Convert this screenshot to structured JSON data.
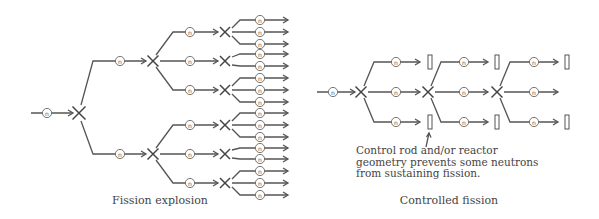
{
  "colors": {
    "line": "#555555",
    "text": "#444444",
    "background": "#ffffff"
  },
  "neutron_label": "n",
  "fission_explosion": {
    "caption": "Fission explosion",
    "input": {
      "x0": 31,
      "nx": 47,
      "x1": 73,
      "y": 113
    },
    "root_x": {
      "x": 79,
      "y": 113
    },
    "level2": [
      {
        "y": 61,
        "branch_x": 93,
        "nx": 120,
        "arrow_end": 146,
        "x_at": 153
      },
      {
        "y": 154,
        "branch_x": 93,
        "nx": 120,
        "arrow_end": 146,
        "x_at": 153
      }
    ],
    "level3": [
      {
        "parent": 0,
        "y": 32,
        "nx": 190,
        "arrow_end": 218,
        "x_at": 225,
        "outputs": [
          20,
          32,
          44
        ]
      },
      {
        "parent": 0,
        "y": 61,
        "nx": 190,
        "arrow_end": 218,
        "x_at": 225,
        "outputs": [
          54,
          66
        ]
      },
      {
        "parent": 0,
        "y": 90,
        "nx": 190,
        "arrow_end": 218,
        "x_at": 225,
        "outputs": [
          78,
          90,
          102
        ]
      },
      {
        "parent": 1,
        "y": 125,
        "nx": 190,
        "arrow_end": 218,
        "x_at": 225,
        "outputs": [
          113,
          125,
          137
        ]
      },
      {
        "parent": 1,
        "y": 154,
        "nx": 190,
        "arrow_end": 218,
        "x_at": 225,
        "outputs": [
          148,
          159
        ]
      },
      {
        "parent": 1,
        "y": 183,
        "nx": 190,
        "arrow_end": 218,
        "x_at": 225,
        "outputs": [
          171,
          183,
          195
        ]
      }
    ],
    "outputs": {
      "x_start": 240,
      "nx": 260,
      "arrow_end": 288
    },
    "caption_pos": {
      "x": 160,
      "y": 204
    }
  },
  "controlled_fission": {
    "caption": "Controlled fission",
    "annotation": [
      "Control rod and/or reactor",
      "geometry prevents some neutrons",
      "from sustaining fission."
    ],
    "annotation_pos": {
      "x": 356,
      "y": 154,
      "line_height": 11.5
    },
    "pointer": {
      "x1": 426,
      "y1": 147,
      "x2": 429,
      "y2": 133
    },
    "input": {
      "x0": 317,
      "nx": 333,
      "x1": 355,
      "y": 92
    },
    "stages": [
      {
        "x_at": 361,
        "y": 92,
        "rows": [
          62,
          92,
          122
        ],
        "branch_x": 374,
        "nx": 396,
        "arrow_end": 420,
        "rods": [
          true,
          false,
          true
        ],
        "rod_x": 430
      },
      {
        "x_at": 428,
        "y": 92,
        "rows": [
          62,
          92,
          122
        ],
        "branch_x": 441,
        "nx": 464,
        "arrow_end": 488,
        "rods": [
          true,
          false,
          true
        ],
        "rod_x": 497
      },
      {
        "x_at": 497,
        "y": 92,
        "rows": [
          62,
          92,
          122
        ],
        "branch_x": 510,
        "nx": 534,
        "arrow_end": 558,
        "rods": [
          true,
          false,
          true
        ],
        "rod_x": 567
      }
    ],
    "caption_pos": {
      "x": 449,
      "y": 204
    }
  }
}
